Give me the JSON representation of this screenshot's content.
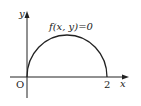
{
  "diagram": {
    "curve_label": "f(x, y)=0",
    "origin_label": "O",
    "x_tick_label": "2",
    "x_axis_label": "x",
    "y_axis_label": "y",
    "colors": {
      "stroke": "#222222",
      "background": "#ffffff"
    }
  }
}
